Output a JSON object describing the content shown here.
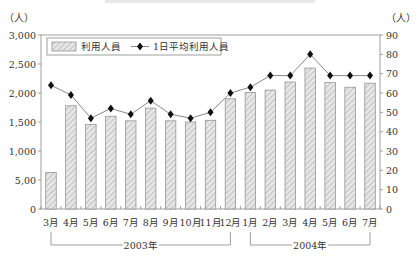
{
  "chart_data": {
    "type": "bar+line",
    "title": "",
    "categories": [
      "3月",
      "4月",
      "5月",
      "6月",
      "7月",
      "8月",
      "9月",
      "10月",
      "11月",
      "12月",
      "1月",
      "2月",
      "3月",
      "4月",
      "5月",
      "6月",
      "7月"
    ],
    "year_groups": [
      {
        "label": "2003年",
        "start": 0,
        "end": 9
      },
      {
        "label": "2004年",
        "start": 10,
        "end": 16
      }
    ],
    "series": [
      {
        "name": "利用人員",
        "type": "bar",
        "axis": "left",
        "values": [
          630,
          1780,
          1460,
          1600,
          1520,
          1740,
          1520,
          1500,
          1530,
          1900,
          2010,
          2050,
          2190,
          2430,
          2180,
          2100,
          2170
        ]
      },
      {
        "name": "1日平均利用人員",
        "type": "line",
        "axis": "right",
        "values": [
          64,
          59,
          47,
          52,
          49,
          56,
          49,
          47,
          50,
          60,
          63,
          69,
          69,
          80,
          69,
          69,
          69
        ]
      }
    ],
    "left_axis": {
      "unit": "（人）",
      "ylim": [
        0,
        3000
      ],
      "ticks": [
        "0",
        "5,00",
        "1,000",
        "1,500",
        "2,000",
        "2,500",
        "3,000"
      ]
    },
    "right_axis": {
      "unit": "（人）",
      "ylim": [
        0,
        90
      ],
      "ticks": [
        "0",
        "10",
        "20",
        "30",
        "40",
        "50",
        "60",
        "70",
        "80",
        "90"
      ]
    },
    "legend": {
      "position": "top-left-inside",
      "entries": [
        "利用人員",
        "1日平均利用人員"
      ]
    },
    "grid": false,
    "colors": {
      "bar_fill": "#e4e4e4",
      "bar_hatch": "#b5b5b5",
      "bar_stroke": "#8a8a8a",
      "line": "#7a7a7a",
      "marker": "#111111",
      "axis": "#888888"
    }
  }
}
